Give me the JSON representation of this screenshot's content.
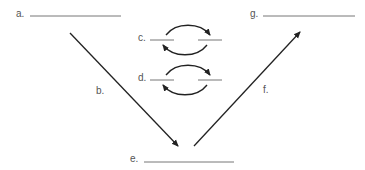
{
  "diagram": {
    "type": "cycle-with-blanks",
    "colors": {
      "line": "#222222",
      "blank": "#777777",
      "text": "#555555"
    },
    "labels": {
      "a": "a.",
      "b": "b.",
      "c": "c.",
      "d": "d.",
      "e": "e.",
      "f": "f.",
      "g": "g."
    },
    "elements": [
      {
        "id": "a",
        "kind": "blank",
        "label": "a.",
        "value": ""
      },
      {
        "id": "b",
        "kind": "arrow",
        "label": "b.",
        "direction": "down-right",
        "from": "a",
        "to": "e"
      },
      {
        "id": "c",
        "kind": "reversible-blanks",
        "label": "c.",
        "values": [
          "",
          ""
        ]
      },
      {
        "id": "d",
        "kind": "reversible-blanks",
        "label": "d.",
        "values": [
          "",
          ""
        ]
      },
      {
        "id": "e",
        "kind": "blank",
        "label": "e.",
        "value": ""
      },
      {
        "id": "f",
        "kind": "arrow",
        "label": "f.",
        "direction": "up-right",
        "from": "e",
        "to": "g"
      },
      {
        "id": "g",
        "kind": "blank",
        "label": "g.",
        "value": ""
      }
    ]
  }
}
